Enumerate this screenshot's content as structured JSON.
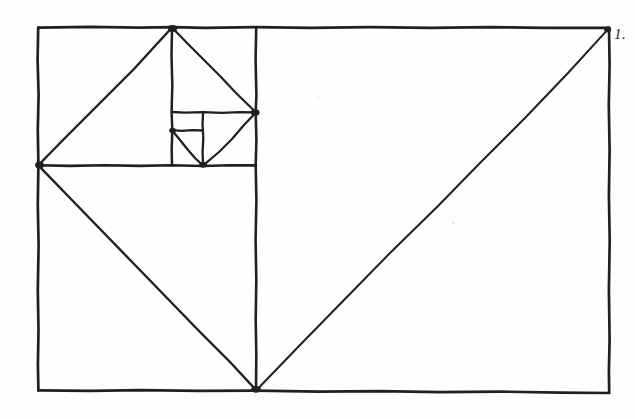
{
  "figure": {
    "style": "hand-drawn pen-and-ink line figure on paper",
    "label": "1.",
    "label_position": "top-right outside frame",
    "background_color": "#fefefe",
    "ink_color": "#231f1c",
    "canvas": {
      "width": 635,
      "height": 419
    },
    "frame": {
      "name": "outer-golden-rectangle",
      "x1": 38,
      "y1": 27,
      "x2": 609,
      "y2": 393,
      "width": 571,
      "height": 366,
      "ratio": "approximately 1.618 : 1"
    },
    "geometry": {
      "description": "Outer golden rectangle recursively divided into a sequence of squares, each square carrying a corner-to-corner diagonal chord that approximates the golden spiral.",
      "squares": [
        {
          "name": "square-1-largest-right",
          "x1": 256,
          "y1": 27,
          "x2": 609,
          "y2": 393,
          "side": 353,
          "diagonal_from": [
            256,
            390
          ],
          "diagonal_to": [
            609,
            28
          ]
        },
        {
          "name": "square-2-lower-left",
          "x1": 38,
          "y1": 165,
          "x2": 256,
          "y2": 390,
          "side": 221,
          "diagonal_from": [
            38,
            165
          ],
          "diagonal_to": [
            256,
            390
          ]
        },
        {
          "name": "square-3-upper-left",
          "x1": 38,
          "y1": 27,
          "x2": 172,
          "y2": 165,
          "side": 136,
          "diagonal_from": [
            38,
            165
          ],
          "diagonal_to": [
            172,
            27
          ]
        },
        {
          "name": "square-4-upper-mid",
          "x1": 172,
          "y1": 27,
          "x2": 256,
          "y2": 112,
          "side": 85,
          "diagonal_from": [
            172,
            27
          ],
          "diagonal_to": [
            256,
            112
          ]
        },
        {
          "name": "square-5-right-small",
          "x1": 203,
          "y1": 112,
          "x2": 256,
          "y2": 165,
          "side": 53,
          "diagonal_from": [
            256,
            112
          ],
          "diagonal_to": [
            203,
            165
          ]
        },
        {
          "name": "square-6-left-small",
          "x1": 172,
          "y1": 130,
          "x2": 203,
          "y2": 165,
          "side": 33,
          "diagonal_from": [
            172,
            130
          ],
          "diagonal_to": [
            203,
            165
          ]
        },
        {
          "name": "square-7-smallest",
          "x1": 172,
          "y1": 112,
          "x2": 203,
          "y2": 130,
          "side": 18,
          "diagonal_from": null,
          "diagonal_to": null
        }
      ],
      "division_lines": [
        {
          "name": "vertical-divider-main",
          "orientation": "vertical",
          "x": 256,
          "from": 27,
          "to": 390
        },
        {
          "name": "horizontal-divider-main",
          "orientation": "horizontal",
          "y": 165,
          "from": 38,
          "to": 256
        },
        {
          "name": "vertical-divider-2",
          "orientation": "vertical",
          "x": 172,
          "from": 27,
          "to": 165
        },
        {
          "name": "horizontal-divider-2",
          "orientation": "horizontal",
          "y": 112,
          "from": 172,
          "to": 256
        },
        {
          "name": "vertical-divider-3",
          "orientation": "vertical",
          "x": 203,
          "from": 112,
          "to": 165
        },
        {
          "name": "horizontal-divider-3",
          "orientation": "horizontal",
          "y": 130,
          "from": 172,
          "to": 203
        }
      ],
      "spiral_vertices": [
        {
          "name": "vertex-top",
          "x": 172,
          "y": 27
        },
        {
          "name": "vertex-left",
          "x": 38,
          "y": 165
        },
        {
          "name": "vertex-bottom",
          "x": 256,
          "y": 390
        },
        {
          "name": "vertex-right",
          "x": 609,
          "y": 28
        },
        {
          "name": "vertex-mid-right",
          "x": 256,
          "y": 112
        },
        {
          "name": "vertex-inner-bottom",
          "x": 203,
          "y": 165
        },
        {
          "name": "vertex-inner-left",
          "x": 172,
          "y": 130
        }
      ]
    }
  }
}
